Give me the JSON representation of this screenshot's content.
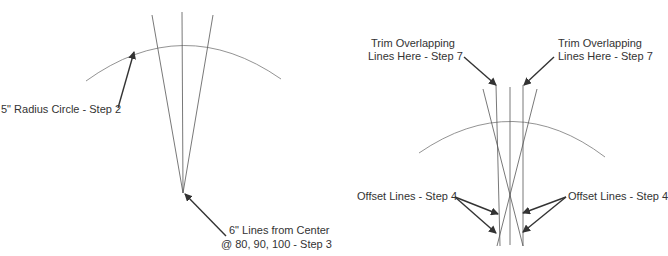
{
  "left_figure": {
    "circle_label": "5\" Radius Circle - Step 2",
    "lines_label_line1": "6\" Lines from Center",
    "lines_label_line2": "@ 80, 90, 100 - Step 3"
  },
  "right_figure": {
    "trim_left_line1": "Trim Overlapping",
    "trim_left_line2": "Lines Here - Step 7",
    "trim_right_line1": "Trim Overlapping",
    "trim_right_line2": "Lines Here - Step 7",
    "offset_left": "Offset Lines - Step 4",
    "offset_right": "Offset Lines - Step 4"
  },
  "colors": {
    "line": "#555555",
    "arrow": "#333333",
    "text": "#333333"
  }
}
